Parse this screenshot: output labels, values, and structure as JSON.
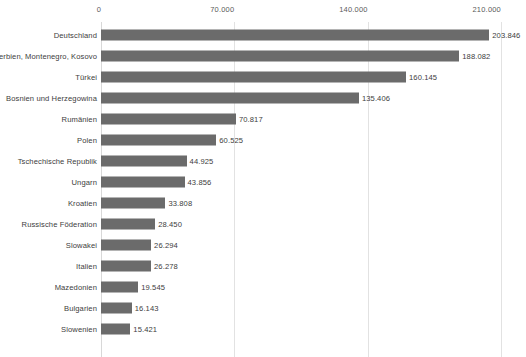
{
  "chart_data": {
    "type": "bar",
    "orientation": "horizontal",
    "title": "",
    "subtitle": "",
    "xlabel": "",
    "ylabel": "",
    "xlim": [
      0,
      210000
    ],
    "xticks": [
      0,
      70000,
      140000,
      210000
    ],
    "xtick_labels": [
      "0",
      "70.000",
      "140.000",
      "210.000"
    ],
    "grid": true,
    "grid_axis": "x",
    "legend": null,
    "bar_color": "#6b6b6b",
    "value_labels_shown": true,
    "categories": [
      "Deutschland",
      "Serbien, Montenegro, Kosovo",
      "Türkei",
      "Bosnien und Herzegowina",
      "Rumänien",
      "Polen",
      "Tschechische Republik",
      "Ungarn",
      "Kroatien",
      "Russische Föderation",
      "Slowakei",
      "Italien",
      "Mazedonien",
      "Bulgarien",
      "Slowenien"
    ],
    "values": [
      203846,
      188082,
      160145,
      135406,
      70817,
      60525,
      44925,
      43856,
      33808,
      28450,
      26294,
      26278,
      19545,
      16143,
      15421
    ],
    "value_labels": [
      "203.846",
      "188.082",
      "160.145",
      "135.406",
      "70.817",
      "60.525",
      "44.925",
      "43.856",
      "33.808",
      "28.450",
      "26.294",
      "26.278",
      "19.545",
      "16.143",
      "15.421"
    ]
  }
}
